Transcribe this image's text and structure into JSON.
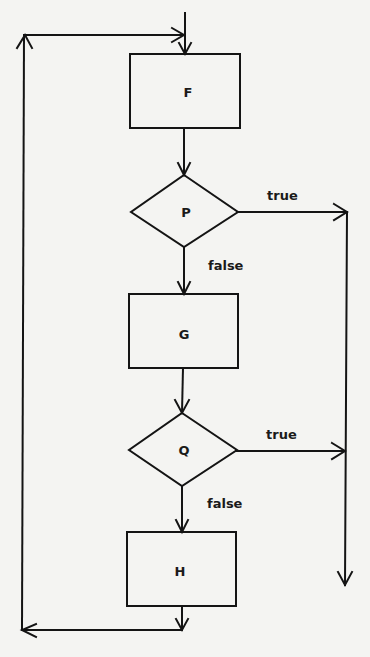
{
  "diagram": {
    "type": "flowchart",
    "colors": {
      "background": "#f4f4f2",
      "stroke": "#141414"
    },
    "nodes": [
      {
        "id": "F",
        "kind": "process",
        "label": "F"
      },
      {
        "id": "P",
        "kind": "decision",
        "label": "P"
      },
      {
        "id": "G",
        "kind": "process",
        "label": "G"
      },
      {
        "id": "Q",
        "kind": "decision",
        "label": "Q"
      },
      {
        "id": "H",
        "kind": "process",
        "label": "H"
      }
    ],
    "edges": [
      {
        "from": "entry",
        "to": "F",
        "label": ""
      },
      {
        "from": "F",
        "to": "P",
        "label": ""
      },
      {
        "from": "P",
        "to": "exit",
        "label": "true"
      },
      {
        "from": "P",
        "to": "G",
        "label": "false"
      },
      {
        "from": "G",
        "to": "Q",
        "label": ""
      },
      {
        "from": "Q",
        "to": "exit",
        "label": "true"
      },
      {
        "from": "Q",
        "to": "H",
        "label": "false"
      },
      {
        "from": "H",
        "to": "F",
        "label": ""
      }
    ],
    "labels": {
      "p_true": "true",
      "p_false": "false",
      "q_true": "true",
      "q_false": "false"
    }
  }
}
